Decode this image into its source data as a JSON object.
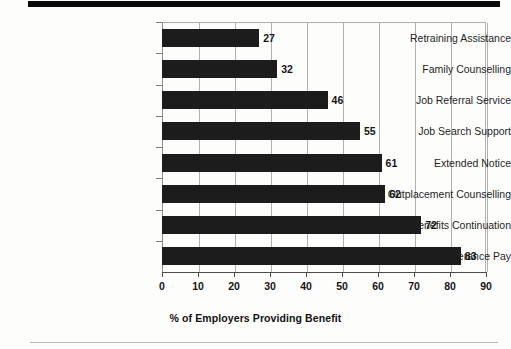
{
  "page": {
    "top_rule": "thick-black-rule",
    "bottom_rule": "thin-grey-rule"
  },
  "chart_data": {
    "type": "bar",
    "orientation": "horizontal",
    "title": "",
    "subtitle": "",
    "xlabel": "% of Employers Providing Benefit",
    "ylabel": "",
    "categories": [
      "Retraining Assistance",
      "Family Counselling",
      "Job Referral Service",
      "Job Search Support",
      "Extended Notice",
      "Outplacement Counselling",
      "Benefits Continuation",
      "Severance Pay"
    ],
    "values": [
      27,
      32,
      46,
      55,
      61,
      62,
      72,
      83
    ],
    "value_labels": [
      "27",
      "32",
      "46",
      "55",
      "61",
      "62",
      "72",
      "83"
    ],
    "xlim": [
      0,
      90
    ],
    "xticks": [
      0,
      10,
      20,
      30,
      40,
      50,
      60,
      70,
      80,
      90
    ],
    "xtick_labels": [
      "0",
      "10",
      "20",
      "30",
      "40",
      "50",
      "60",
      "70",
      "80",
      "90"
    ],
    "grid": "vertical",
    "legend": "none",
    "bar_color": "#1c1c1c",
    "grid_color": "#b0b0b0",
    "axis_color": "#4a4a4a",
    "background_color": "#ffffff"
  }
}
